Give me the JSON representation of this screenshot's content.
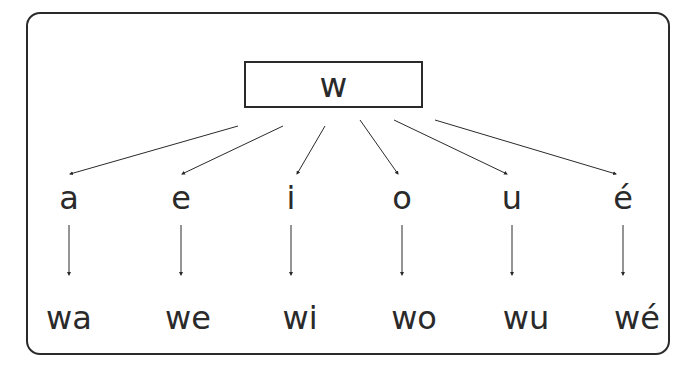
{
  "diagram": {
    "root": "w",
    "vowels": [
      "a",
      "e",
      "i",
      "o",
      "u",
      "é"
    ],
    "syllables": [
      "wa",
      "we",
      "wi",
      "wo",
      "wu",
      "wé"
    ],
    "line_color": "#2a2a2a"
  }
}
